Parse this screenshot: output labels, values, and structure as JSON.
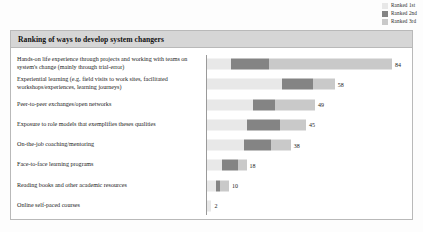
{
  "legend": {
    "items": [
      {
        "label": "Ranked 1st",
        "color": "#e8e8e8",
        "key": "ranked_1st"
      },
      {
        "label": "Ranked 2nd",
        "color": "#848484",
        "key": "ranked_2nd"
      },
      {
        "label": "Ranked 3rd",
        "color": "#c9c9c9",
        "key": "ranked_3rd"
      }
    ]
  },
  "panel": {
    "title": "Ranking of ways to develop system changers"
  },
  "chart_data": {
    "type": "bar",
    "orientation": "horizontal",
    "stacked": true,
    "title": "Ranking of ways to develop system changers",
    "xlabel": "",
    "ylabel": "",
    "grid": false,
    "legend_position": "top-right",
    "axis_origin_visible": true,
    "xlim": [
      0,
      84
    ],
    "categories": [
      "Hands-on life experience through projects and working with teams on system's change (mainly through trial-error)",
      "Experiential learning (e.g. field visits to work sites, facilitated workshops/experiences, learning journeys)",
      "Peer-to-peer exchanges/open networks",
      "Exposure to role models that exemplifies theses qualities",
      "On-the-job coaching/mentoring",
      "Face-to-face learning programs",
      "Reading books and other academic resources",
      "Online self-paced courses"
    ],
    "series": [
      {
        "name": "Ranked 1st",
        "color": "#e8e8e8",
        "values": [
          11,
          34,
          21,
          18,
          17,
          7,
          4,
          2
        ]
      },
      {
        "name": "Ranked 2nd",
        "color": "#848484",
        "values": [
          17,
          14,
          10,
          15,
          12,
          7,
          2,
          0
        ]
      },
      {
        "name": "Ranked 3rd",
        "color": "#c9c9c9",
        "values": [
          56,
          10,
          18,
          12,
          9,
          4,
          4,
          0
        ]
      }
    ],
    "totals": [
      84,
      58,
      49,
      45,
      38,
      18,
      10,
      2
    ],
    "total_labels": [
      "84",
      "58",
      "49",
      "45",
      "38",
      "18",
      "10",
      "2"
    ]
  },
  "rows": [
    {
      "label": "Hands-on life experience through projects and working with teams on system's change (mainly through trial-error)",
      "value_label": "84"
    },
    {
      "label": "Experiential learning (e.g. field visits to work sites, facilitated workshops/experiences, learning journeys)",
      "value_label": "58"
    },
    {
      "label": "Peer-to-peer exchanges/open networks",
      "value_label": "49"
    },
    {
      "label": "Exposure to role models that exemplifies theses qualities",
      "value_label": "45"
    },
    {
      "label": "On-the-job coaching/mentoring",
      "value_label": "38"
    },
    {
      "label": "Face-to-face learning programs",
      "value_label": "18"
    },
    {
      "label": "Reading books and other academic resources",
      "value_label": "10"
    },
    {
      "label": "Online self-paced courses",
      "value_label": "2"
    }
  ]
}
